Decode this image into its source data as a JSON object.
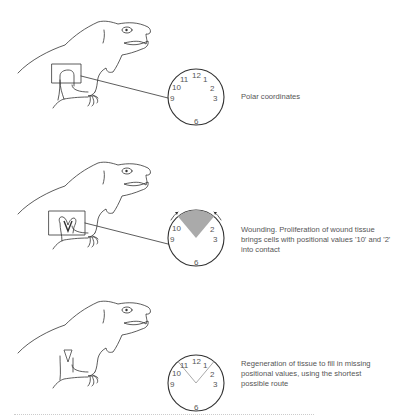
{
  "panels": [
    {
      "id": "intact",
      "caption": "Polar coordinates",
      "clock_labels": [
        "12",
        "1",
        "2",
        "3",
        "6",
        "9",
        "10",
        "11"
      ],
      "wound": false,
      "regenerated": false
    },
    {
      "id": "wounding",
      "caption": "Wounding. Proliferation of wound tissue brings cells with positional values '10' and '2' into contact",
      "clock_labels": [
        "2",
        "3",
        "6",
        "9",
        "10"
      ],
      "wound": true,
      "regenerated": false
    },
    {
      "id": "regeneration",
      "caption": "Regeneration of tissue to fill in missing positional values, using the shortest possible route",
      "clock_labels": [
        "12",
        "1",
        "2",
        "3",
        "6",
        "9",
        "10",
        "11"
      ],
      "wound": false,
      "regenerated": true
    }
  ],
  "colors": {
    "line": "#333333",
    "wound_fill": "#aaaaaa",
    "regen_line": "#aaaaaa",
    "text": "#555555"
  }
}
